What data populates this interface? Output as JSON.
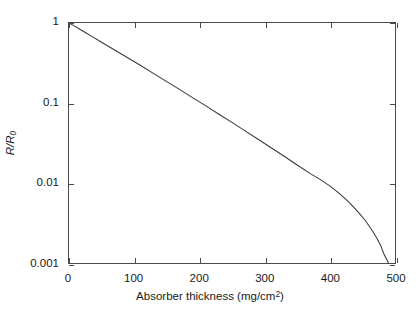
{
  "chart_data": {
    "type": "line",
    "title": "",
    "xlabel": "Absorber thickness (mg/cm2)",
    "xlabel_prefix": "Absorber thickness (mg/cm",
    "xlabel_exponent": "2",
    "xlabel_suffix": ")",
    "ylabel": "R/R0",
    "ylabel_main": "R/R",
    "ylabel_sub": "0",
    "yscale": "log",
    "xscale": "linear",
    "xlim": [
      0,
      500
    ],
    "ylim": [
      0.001,
      1
    ],
    "grid": false,
    "legend": null,
    "xticks": [
      0,
      100,
      200,
      300,
      400,
      500
    ],
    "xtick_labels": [
      "0",
      "100",
      "200",
      "300",
      "400",
      "500"
    ],
    "yticks": [
      1,
      0.1,
      0.01,
      0.001
    ],
    "ytick_labels": [
      "1",
      "0.1",
      "0.01",
      "0.001"
    ],
    "series": [
      {
        "name": "beta absorption",
        "color": "#3a3a3a",
        "linewidth": 1.1,
        "x": [
          0,
          8,
          16,
          25,
          35,
          50,
          70,
          90,
          110,
          130,
          150,
          170,
          190,
          210,
          230,
          250,
          270,
          290,
          310,
          330,
          350,
          370,
          385,
          400,
          415,
          430,
          445,
          455,
          465,
          472,
          478,
          483,
          487,
          490
        ],
        "y": [
          1.0,
          0.92,
          0.84,
          0.76,
          0.68,
          0.575,
          0.46,
          0.368,
          0.294,
          0.233,
          0.185,
          0.147,
          0.116,
          0.092,
          0.0725,
          0.0572,
          0.0448,
          0.0352,
          0.0276,
          0.0216,
          0.0168,
          0.0131,
          0.0111,
          0.0092,
          0.00735,
          0.0057,
          0.0042,
          0.00335,
          0.00255,
          0.00205,
          0.00165,
          0.0013,
          0.00112,
          0.001
        ]
      }
    ]
  },
  "axes": {
    "x_title": "Absorber thickness (mg/cm",
    "x_title_exp": "2",
    "x_title_end": ")",
    "y_title_main": "R/R",
    "y_title_sub": "0"
  },
  "ticks": {
    "x": [
      {
        "label": "0",
        "value": 0
      },
      {
        "label": "100",
        "value": 100
      },
      {
        "label": "200",
        "value": 200
      },
      {
        "label": "300",
        "value": 300
      },
      {
        "label": "400",
        "value": 400
      },
      {
        "label": "500",
        "value": 500
      }
    ],
    "y": [
      {
        "label": "1",
        "value": 1
      },
      {
        "label": "0.1",
        "value": 0.1
      },
      {
        "label": "0.01",
        "value": 0.01
      },
      {
        "label": "0.001",
        "value": 0.001
      }
    ]
  },
  "style": {
    "background": "#ffffff",
    "axis_color": "#4a4a4a",
    "line_color": "#3a3a3a",
    "text_color": "#1a1a1a"
  }
}
